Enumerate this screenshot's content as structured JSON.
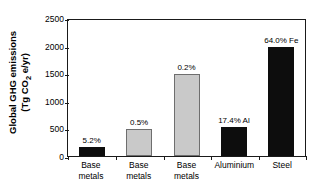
{
  "chart_data": {
    "type": "bar",
    "title": "",
    "xlabel": "",
    "ylabel": "Global GHG emissions (Tg CO2 e/yr)",
    "ylabel_line1": "Global GHG emissions",
    "ylabel_line2_pre": "(Tg CO",
    "ylabel_line2_sub": "2",
    "ylabel_line2_post": " e/yr)",
    "ylim": [
      0,
      2500
    ],
    "yticks": [
      2500,
      2000,
      1500,
      1000,
      500,
      0
    ],
    "ytick_labels": [
      "2500",
      "2000",
      "1500",
      "1000",
      "500",
      "0"
    ],
    "grid": false,
    "legend": "none",
    "categories": [
      "Base metals",
      "Base metals",
      "Base metals",
      "Aluminium",
      "Steel"
    ],
    "category_lines": [
      [
        "Base",
        "metals"
      ],
      [
        "Base",
        "metals"
      ],
      [
        "Base",
        "metals"
      ],
      [
        "Aluminium",
        ""
      ],
      [
        "Steel",
        ""
      ]
    ],
    "values": [
      165,
      490,
      1490,
      530,
      1970
    ],
    "bar_labels": [
      "5.2%",
      "0.5%",
      "0.2%",
      "17.4% Al",
      "64.0% Fe"
    ],
    "bar_colors": [
      "#0d0d0d",
      "#c9c9c9",
      "#c9c9c9",
      "#0d0d0d",
      "#0d0d0d"
    ],
    "bar_styles": [
      "dark",
      "light",
      "light",
      "dark",
      "dark"
    ],
    "colors": {
      "dark_bar": "#0d0d0d",
      "light_bar": "#c9c9c9",
      "light_bar_edge": "#6e6e6e",
      "axis": "#1a1a1a",
      "text": "#000000",
      "background": "#ffffff"
    }
  }
}
